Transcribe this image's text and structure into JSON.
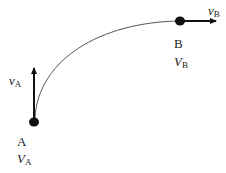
{
  "diagram": {
    "type": "trajectory",
    "colors": {
      "stroke": "#222222",
      "curve": "#555555",
      "background": "#ffffff"
    },
    "points": [
      {
        "id": "A",
        "label": "A",
        "quantity": {
          "symbol": "V",
          "subscript": "A"
        }
      },
      {
        "id": "B",
        "label": "B",
        "quantity": {
          "symbol": "V",
          "subscript": "B"
        }
      }
    ],
    "vectors": [
      {
        "at": "A",
        "direction": "up",
        "symbol": "v",
        "subscript": "A"
      },
      {
        "at": "B",
        "direction": "right",
        "symbol": "v",
        "subscript": "B"
      }
    ]
  }
}
